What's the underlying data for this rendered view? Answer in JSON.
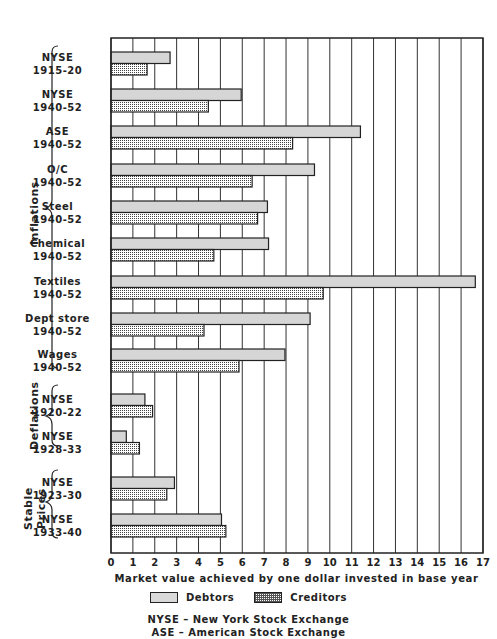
{
  "chart_data": {
    "type": "bar",
    "orientation": "horizontal",
    "title": "",
    "xlabel": "Market value achieved by one dollar invested in base year",
    "ylabel": "",
    "xlim": [
      0,
      17
    ],
    "xticks": [
      0,
      1,
      2,
      3,
      4,
      5,
      6,
      7,
      8,
      9,
      10,
      11,
      12,
      13,
      14,
      15,
      16,
      17
    ],
    "grid": true,
    "legend_position": "bottom",
    "categories": [
      "NYSE 1915-20",
      "NYSE 1940-52",
      "ASE 1940-52",
      "O/C 1940-52",
      "Steel 1940-52",
      "Chemical 1940-52",
      "Textiles 1940-52",
      "Dept store 1940-52",
      "Wages 1940-52",
      "NYSE 1920-22",
      "NYSE 1928-33",
      "NYSE 1923-30",
      "NYSE 1933-40"
    ],
    "groups": [
      {
        "name": "Inflations",
        "categories": [
          0,
          1,
          2,
          3,
          4,
          5,
          6,
          7,
          8
        ]
      },
      {
        "name": "Deflations",
        "categories": [
          9,
          10
        ]
      },
      {
        "name": "Stable Prices",
        "categories": [
          11,
          12
        ]
      }
    ],
    "series": [
      {
        "name": "Debtors",
        "values": [
          2.7,
          5.95,
          11.4,
          9.3,
          7.15,
          7.2,
          16.65,
          9.1,
          7.95,
          1.55,
          0.7,
          2.9,
          5.05
        ]
      },
      {
        "name": "Creditors",
        "values": [
          1.65,
          4.45,
          8.3,
          6.45,
          6.7,
          4.7,
          9.7,
          4.25,
          5.85,
          1.9,
          1.3,
          2.55,
          5.25
        ]
      }
    ],
    "annotations": [
      "NYSE - New York Stock Exchange",
      "ASE - American Stock Exchange"
    ]
  },
  "rows": [
    {
      "line1": "NYSE",
      "line2": "1915-20"
    },
    {
      "line1": "NYSE",
      "line2": "1940-52"
    },
    {
      "line1": "ASE",
      "line2": "1940-52"
    },
    {
      "line1": "O/C",
      "line2": "1940-52"
    },
    {
      "line1": "Steel",
      "line2": "1940-52"
    },
    {
      "line1": "Chemical",
      "line2": "1940-52"
    },
    {
      "line1": "Textiles",
      "line2": "1940-52"
    },
    {
      "line1": "Dept store",
      "line2": "1940-52"
    },
    {
      "line1": "Wages",
      "line2": "1940-52"
    },
    {
      "line1": "NYSE",
      "line2": "1920-22"
    },
    {
      "line1": "NYSE",
      "line2": "1928-33"
    },
    {
      "line1": "NYSE",
      "line2": "1923-30"
    },
    {
      "line1": "NYSE",
      "line2": "1933-40"
    }
  ],
  "groups": {
    "inflations": "Inflations",
    "deflations": "Deflations",
    "stable1": "Stable",
    "stable2": "Prices"
  },
  "legend": {
    "debtors": "Debtors",
    "creditors": "Creditors"
  },
  "xlabel": "Market value achieved by one dollar invested in base year",
  "abbr": {
    "nyse": "NYSE – New York Stock Exchange",
    "ase": "ASE – American Stock Exchange"
  }
}
